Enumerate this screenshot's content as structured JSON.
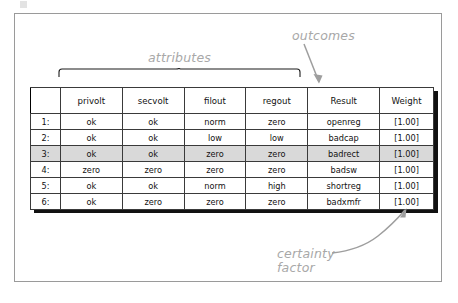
{
  "annotations": {
    "attributes": "attributes",
    "outcomes": "outcomes",
    "certainty_factor": "certainty factor"
  },
  "table": {
    "columns": [
      "",
      "privolt",
      "secvolt",
      "filout",
      "regout",
      "Result",
      "Weight"
    ],
    "rows": [
      {
        "index": "1:",
        "privolt": "ok",
        "secvolt": "ok",
        "filout": "norm",
        "regout": "zero",
        "result": "openreg",
        "weight": "[1.00]",
        "highlighted": false
      },
      {
        "index": "2:",
        "privolt": "ok",
        "secvolt": "ok",
        "filout": "low",
        "regout": "low",
        "result": "badcap",
        "weight": "[1.00]",
        "highlighted": false
      },
      {
        "index": "3:",
        "privolt": "ok",
        "secvolt": "ok",
        "filout": "zero",
        "regout": "zero",
        "result": "badrect",
        "weight": "[1.00]",
        "highlighted": true
      },
      {
        "index": "4:",
        "privolt": "zero",
        "secvolt": "zero",
        "filout": "zero",
        "regout": "zero",
        "result": "badsw",
        "weight": "[1.00]",
        "highlighted": false
      },
      {
        "index": "5:",
        "privolt": "ok",
        "secvolt": "ok",
        "filout": "norm",
        "regout": "high",
        "result": "shortreg",
        "weight": "[1.00]",
        "highlighted": false
      },
      {
        "index": "6:",
        "privolt": "ok",
        "secvolt": "zero",
        "filout": "zero",
        "regout": "zero",
        "result": "badxmfr",
        "weight": "[1.00]",
        "highlighted": false
      }
    ]
  },
  "colors": {
    "annotation_gray": "#a8a8a8",
    "table_border": "#000000",
    "highlight_row": "#d9d9d9",
    "frame_border": "#9a9a9a"
  }
}
